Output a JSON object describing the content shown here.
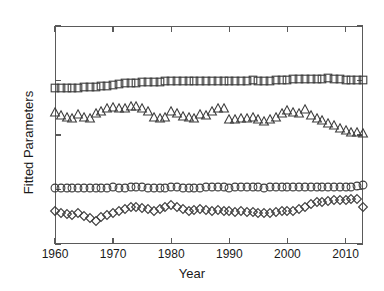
{
  "figure": {
    "background": "#ffffff",
    "marker_stroke": "#3d3d3d",
    "axis_color": "#5a5a5a"
  },
  "axes": {
    "xlabel": "Year",
    "ylabel": "Fitted Parameters",
    "xticks": [
      1960,
      1970,
      1980,
      1990,
      2000,
      2010
    ],
    "xtick_labels": [
      "1960",
      "1970",
      "1980",
      "1990",
      "2000",
      "2010"
    ],
    "yticks": [
      -4,
      0,
      4,
      8,
      12
    ],
    "ytick_labels": [
      "-4",
      "0",
      "4",
      "8",
      "12"
    ],
    "xlim": [
      1960,
      2013
    ],
    "ylim": [
      -4,
      12
    ]
  },
  "chart_data": {
    "type": "scatter",
    "title": "",
    "xlabel": "Year",
    "ylabel": "Fitted Parameters",
    "xlim": [
      1960,
      2013
    ],
    "ylim": [
      -4,
      12
    ],
    "grid": false,
    "legend": "none",
    "x": [
      1960,
      1961,
      1962,
      1963,
      1964,
      1965,
      1966,
      1967,
      1968,
      1969,
      1970,
      1971,
      1972,
      1973,
      1974,
      1975,
      1976,
      1977,
      1978,
      1979,
      1980,
      1981,
      1982,
      1983,
      1984,
      1985,
      1986,
      1987,
      1988,
      1989,
      1990,
      1991,
      1992,
      1993,
      1994,
      1995,
      1996,
      1997,
      1998,
      1999,
      2000,
      2001,
      2002,
      2003,
      2004,
      2005,
      2006,
      2007,
      2008,
      2009,
      2010,
      2011,
      2012,
      2013
    ],
    "series": [
      {
        "name": "squares",
        "marker": "square",
        "values": [
          7.42,
          7.45,
          7.46,
          7.47,
          7.48,
          7.5,
          7.52,
          7.54,
          7.56,
          7.6,
          7.7,
          7.76,
          7.8,
          7.82,
          7.84,
          7.86,
          7.88,
          7.9,
          7.92,
          7.95,
          7.96,
          7.95,
          7.94,
          7.96,
          7.98,
          7.97,
          7.96,
          7.98,
          7.99,
          7.98,
          7.96,
          7.97,
          7.99,
          8.0,
          8.02,
          8.0,
          7.98,
          8.0,
          8.02,
          8.04,
          8.06,
          8.08,
          8.1,
          8.12,
          8.1,
          8.12,
          8.14,
          8.16,
          8.12,
          8.08,
          8.06,
          8.04,
          8.02,
          8.04
        ]
      },
      {
        "name": "triangles",
        "marker": "triangle",
        "values": [
          5.7,
          5.5,
          5.35,
          5.25,
          5.55,
          5.3,
          5.25,
          5.6,
          5.75,
          5.95,
          6.05,
          6.0,
          5.95,
          6.15,
          6.1,
          5.95,
          5.75,
          5.35,
          5.25,
          5.3,
          5.75,
          5.6,
          5.4,
          5.3,
          5.25,
          5.55,
          5.5,
          5.75,
          5.95,
          6.0,
          5.15,
          5.2,
          5.25,
          5.28,
          5.3,
          5.2,
          5.0,
          5.15,
          5.35,
          5.6,
          5.85,
          5.7,
          5.65,
          5.9,
          5.45,
          5.25,
          5.1,
          4.9,
          4.7,
          4.5,
          4.35,
          4.25,
          4.2,
          4.15
        ]
      },
      {
        "name": "circles",
        "marker": "circle",
        "values": [
          0.12,
          0.1,
          0.08,
          0.09,
          0.11,
          0.1,
          0.08,
          0.1,
          0.12,
          0.14,
          0.15,
          0.14,
          0.12,
          0.15,
          0.16,
          0.15,
          0.14,
          0.12,
          0.11,
          0.13,
          0.16,
          0.15,
          0.13,
          0.12,
          0.11,
          0.14,
          0.15,
          0.17,
          0.19,
          0.2,
          0.14,
          0.15,
          0.16,
          0.17,
          0.18,
          0.16,
          0.14,
          0.15,
          0.17,
          0.19,
          0.21,
          0.2,
          0.19,
          0.22,
          0.2,
          0.19,
          0.18,
          0.17,
          0.16,
          0.18,
          0.2,
          0.22,
          0.24,
          0.3
        ]
      },
      {
        "name": "diamonds",
        "marker": "diamond",
        "values": [
          -1.55,
          -1.7,
          -1.8,
          -1.85,
          -1.75,
          -1.95,
          -2.1,
          -2.3,
          -2.05,
          -1.85,
          -1.7,
          -1.6,
          -1.45,
          -1.3,
          -1.25,
          -1.35,
          -1.45,
          -1.55,
          -1.4,
          -1.3,
          -1.15,
          -1.25,
          -1.45,
          -1.55,
          -1.5,
          -1.45,
          -1.5,
          -1.55,
          -1.5,
          -1.55,
          -1.6,
          -1.65,
          -1.6,
          -1.62,
          -1.64,
          -1.7,
          -1.75,
          -1.7,
          -1.65,
          -1.6,
          -1.55,
          -1.6,
          -1.45,
          -1.25,
          -1.05,
          -0.95,
          -0.9,
          -0.85,
          -0.8,
          -0.78,
          -0.75,
          -0.72,
          -0.7,
          -1.3
        ]
      }
    ]
  }
}
